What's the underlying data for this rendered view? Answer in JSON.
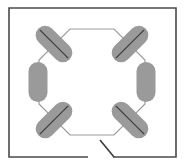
{
  "figure": {
    "type": "floor-plan-diagram",
    "canvas": {
      "width": 187,
      "height": 168,
      "background": "#ffffff"
    },
    "colors": {
      "outer_wall": "#4a4a4a",
      "octagon_outline": "#9b9b9b",
      "capsule_fill": "#9a9a9a",
      "capsule_line": "#3c3c3c",
      "door_swing": "#3c3c3c",
      "background": "#ffffff"
    },
    "outer_room": {
      "name": "outer-room-boundary",
      "stroke_width": 1.6,
      "corners": [
        {
          "x": 9,
          "y": 8
        },
        {
          "x": 176,
          "y": 8
        },
        {
          "x": 176,
          "y": 157
        },
        {
          "x": 113,
          "y": 157
        },
        {
          "x": 88,
          "y": 157
        },
        {
          "x": 9,
          "y": 157
        }
      ],
      "opening": {
        "from_x": 88,
        "to_x": 113,
        "y": 157,
        "label": "doorway-gap"
      }
    },
    "door": {
      "name": "door-leaf",
      "x1": 100,
      "y1": 140,
      "x2": 114,
      "y2": 157,
      "stroke_width": 1.6
    },
    "octagon": {
      "name": "octagon-outline",
      "center_x": 92,
      "center_y": 82,
      "stroke_width": 1.2,
      "vertices": [
        {
          "x": 70,
          "y": 29
        },
        {
          "x": 114,
          "y": 29
        },
        {
          "x": 145,
          "y": 60
        },
        {
          "x": 145,
          "y": 104
        },
        {
          "x": 114,
          "y": 135
        },
        {
          "x": 70,
          "y": 135
        },
        {
          "x": 39,
          "y": 104
        },
        {
          "x": 39,
          "y": 60
        }
      ]
    },
    "capsules": [
      {
        "name": "capsule-top-left",
        "cx": 54,
        "cy": 44,
        "length": 44,
        "thickness": 19,
        "angle": 45,
        "line_length": 40
      },
      {
        "name": "capsule-top-right",
        "cx": 130,
        "cy": 44,
        "length": 44,
        "thickness": 19,
        "angle": -45,
        "line_length": 40
      },
      {
        "name": "capsule-left",
        "cx": 38,
        "cy": 82,
        "length": 40,
        "thickness": 19,
        "angle": 90,
        "line_length": 0
      },
      {
        "name": "capsule-right",
        "cx": 146,
        "cy": 82,
        "length": 40,
        "thickness": 19,
        "angle": 90,
        "line_length": 0
      },
      {
        "name": "capsule-bottom-left",
        "cx": 54,
        "cy": 120,
        "length": 44,
        "thickness": 19,
        "angle": -45,
        "line_length": 40
      },
      {
        "name": "capsule-bottom-right",
        "cx": 130,
        "cy": 120,
        "length": 44,
        "thickness": 19,
        "angle": 45,
        "line_length": 40
      }
    ]
  }
}
